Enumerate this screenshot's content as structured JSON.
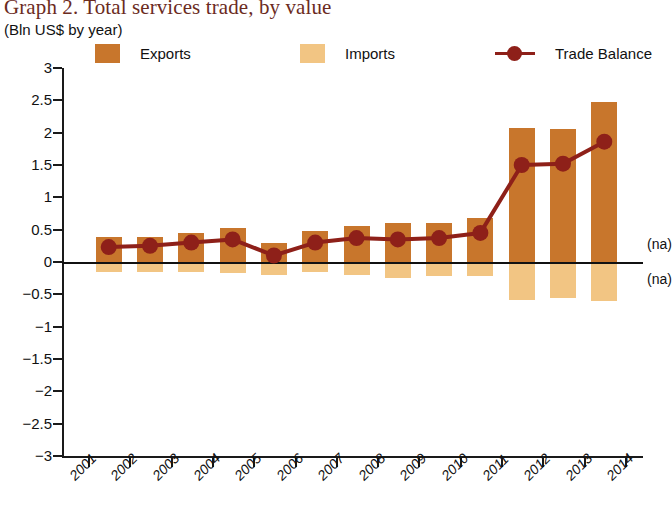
{
  "title": "Graph 2. Total services trade, by value",
  "subtitle": "(Bln US$ by year)",
  "colors": {
    "export_bar": "#c8762c",
    "import_bar": "#f2c583",
    "balance_line": "#8e2019",
    "title_text": "#6b2b1e",
    "axis": "#1a1a1a"
  },
  "legend": [
    {
      "label": "Exports",
      "type": "swatch",
      "color": "#c8762c"
    },
    {
      "label": "Imports",
      "type": "swatch",
      "color": "#f2c583"
    },
    {
      "label": "Trade Balance",
      "type": "line-marker",
      "color": "#8e2019"
    }
  ],
  "annotations": [
    {
      "name": "na-upper",
      "text": "(na)"
    },
    {
      "name": "na-lower",
      "text": "(na)"
    }
  ],
  "chart_data": {
    "type": "bar",
    "title": "Graph 2. Total services trade, by value",
    "subtitle": "(Bln US$ by year)",
    "xlabel": "",
    "ylabel": "Bln US$ by year",
    "ylim": [
      -3,
      3
    ],
    "ytick_labels": [
      "3",
      "2.5",
      "2",
      "1.5",
      "1",
      "0.5",
      "0",
      "−0.5",
      "−1",
      "−1.5",
      "−2",
      "−2.5",
      "−3"
    ],
    "ytick_values": [
      3,
      2.5,
      2,
      1.5,
      1,
      0.5,
      0,
      -0.5,
      -1,
      -1.5,
      -2,
      -2.5,
      -3
    ],
    "grid": false,
    "legend_position": "top",
    "categories": [
      "2001",
      "2002",
      "2003",
      "2004",
      "2005",
      "2006",
      "2007",
      "2008",
      "2009",
      "2010",
      "2011",
      "2012",
      "2013",
      "2014"
    ],
    "series": [
      {
        "name": "Exports",
        "type": "bar",
        "color": "#c8762c",
        "values": [
          0.38,
          0.39,
          0.45,
          0.52,
          0.3,
          0.48,
          0.55,
          0.6,
          0.6,
          0.68,
          2.07,
          2.05,
          2.48,
          null
        ]
      },
      {
        "name": "Imports",
        "type": "bar",
        "color": "#f2c583",
        "values": [
          -0.15,
          -0.15,
          -0.15,
          -0.17,
          -0.2,
          -0.15,
          -0.2,
          -0.25,
          -0.22,
          -0.22,
          -0.58,
          -0.56,
          -0.6,
          null
        ]
      },
      {
        "name": "Trade Balance",
        "type": "line",
        "color": "#8e2019",
        "values": [
          0.23,
          0.25,
          0.3,
          0.35,
          0.1,
          0.3,
          0.37,
          0.35,
          0.37,
          0.45,
          1.5,
          1.52,
          1.86,
          null
        ]
      }
    ]
  }
}
